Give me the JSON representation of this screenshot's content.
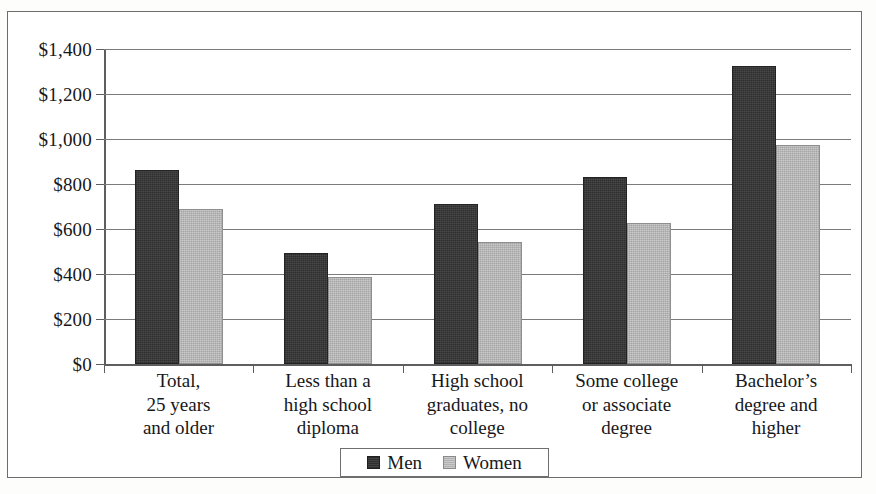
{
  "chart_data": {
    "type": "bar",
    "title": "",
    "xlabel": "",
    "ylabel": "",
    "ylim": [
      0,
      1400
    ],
    "ytick_step": 200,
    "grid": true,
    "legend_position": "bottom-center",
    "currency_prefix": "$",
    "categories": [
      "Total,\n25 years\nand older",
      "Less than a\nhigh school\ndiploma",
      "High school\ngraduates, no\ncollege",
      "Some college\nor associate\ndegree",
      "Bachelor’s\ndegree and\nhigher"
    ],
    "ytick_labels": [
      "$0",
      "$200",
      "$400",
      "$600",
      "$800",
      "$1,000",
      "$1,200",
      "$1,400"
    ],
    "ytick_values": [
      0,
      200,
      400,
      600,
      800,
      1000,
      1200,
      1400
    ],
    "series": [
      {
        "name": "Men",
        "color": "#2e2e2e",
        "values": [
          862,
          495,
          710,
          832,
          1326
        ]
      },
      {
        "name": "Women",
        "color": "#c9c9c9",
        "values": [
          690,
          388,
          542,
          627,
          975
        ]
      }
    ]
  },
  "legend": {
    "items": [
      {
        "label": "Men"
      },
      {
        "label": "Women"
      }
    ]
  }
}
